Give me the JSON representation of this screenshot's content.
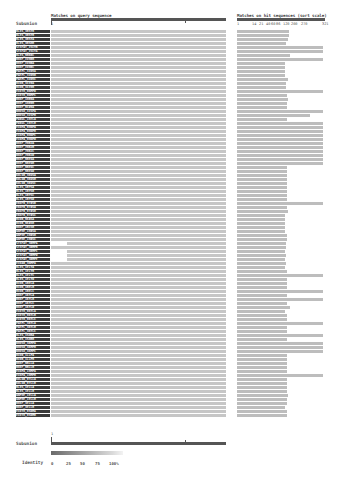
{
  "header": {
    "query_title": "Matches on query sequence",
    "hit_title": "Matches on hit sequences (sort scale)",
    "row_label_title": "Subunion"
  },
  "query_ruler": {
    "start_label": "1",
    "mid_tick_fraction": 0.76
  },
  "hit_ruler": {
    "ticks": [
      "1",
      "14",
      "21",
      "40",
      "60",
      "86",
      "120",
      "200",
      "270",
      "321"
    ]
  },
  "footer": {
    "label": "Subunion",
    "ruler_start_label": "1",
    "identity_label": "Identity",
    "identity_ticks": [
      "0",
      "25",
      "50",
      "75",
      "100%"
    ]
  },
  "colors": {
    "query_bar": "#c6c6c6",
    "hit_bar": "#bdbdbd",
    "ruler": "#555555",
    "label_bg": "#3a3a3a",
    "identity_low": "#6a6a6a",
    "identity_high": "#f3f3f3"
  },
  "rows": [
    {
      "id": "BL4S_3BSYB",
      "q": [
        0,
        1
      ],
      "h": 0.59
    },
    {
      "id": "BL4S_3BSYB",
      "q": [
        0,
        1
      ],
      "h": 0.59
    },
    {
      "id": "BL4S_3BSYA",
      "q": [
        0,
        1
      ],
      "h": 0.58
    },
    {
      "id": "BL4S_3BSHB",
      "q": [
        0,
        1
      ],
      "h": 0.56
    },
    {
      "id": "ST3FAT_ISCYB",
      "q": [
        0,
        1
      ],
      "h": 0.98
    },
    {
      "id": "ST3FAT_ISCYA",
      "q": [
        0,
        1
      ],
      "h": 0.98
    },
    {
      "id": "BL4S_9BKRC",
      "q": [
        0,
        1
      ],
      "h": 0.6
    },
    {
      "id": "BH4F_IVHRB",
      "q": [
        0,
        1
      ],
      "h": 0.98
    },
    {
      "id": "BH4F_IVHRA",
      "q": [
        0,
        1
      ],
      "h": 0.55
    },
    {
      "id": "BH4F_IVHRC",
      "q": [
        0,
        1
      ],
      "h": 0.55
    },
    {
      "id": "PAEPL_3IN5A",
      "q": [
        0,
        1
      ],
      "h": 0.55
    },
    {
      "id": "PAEPL_3IN5B",
      "q": [
        0,
        1
      ],
      "h": 0.55
    },
    {
      "id": "PAEPL_3IN5C",
      "q": [
        0,
        1
      ],
      "h": 0.58
    },
    {
      "id": "BCOR_3IX9A",
      "q": [
        0,
        1
      ],
      "h": 0.56
    },
    {
      "id": "BCOR_3IX9B",
      "q": [
        0,
        1
      ],
      "h": 0.56
    },
    {
      "id": "ECOTH_9NMPD",
      "q": [
        0,
        1
      ],
      "h": 0.98
    },
    {
      "id": "ECOTH_9NMPC",
      "q": [
        0,
        1
      ],
      "h": 0.57
    },
    {
      "id": "BH4F_1HB9A",
      "q": [
        0,
        1
      ],
      "h": 0.58
    },
    {
      "id": "BH4F_1HB9B",
      "q": [
        0,
        1
      ],
      "h": 0.57
    },
    {
      "id": "BH4F_9CD9A",
      "q": [
        0,
        1
      ],
      "h": 0.57
    },
    {
      "id": "RHOSO_3ISPA",
      "q": [
        0,
        1
      ],
      "h": 0.98
    },
    {
      "id": "RHOSO_3ISPB",
      "q": [
        0,
        1
      ],
      "h": 0.83
    },
    {
      "id": "PA9UL_1H7LA",
      "q": [
        0,
        1
      ],
      "h": 0.57
    },
    {
      "id": "PA9UL_1H7LB",
      "q": [
        0,
        1
      ],
      "h": 0.98
    },
    {
      "id": "ECOPA_9HNPA",
      "q": [
        0,
        1
      ],
      "h": 0.98
    },
    {
      "id": "ECOPA_9HNPB",
      "q": [
        0,
        1
      ],
      "h": 0.98
    },
    {
      "id": "ECOPA_9HNPC",
      "q": [
        0,
        1
      ],
      "h": 0.98
    },
    {
      "id": "ECOPA_9HNPD",
      "q": [
        0,
        1
      ],
      "h": 0.98
    },
    {
      "id": "BH4F_7HBJA",
      "q": [
        0,
        1
      ],
      "h": 0.98
    },
    {
      "id": "BH4F_7HBJB",
      "q": [
        0,
        1
      ],
      "h": 0.98
    },
    {
      "id": "BH4F_7HBJC",
      "q": [
        0,
        1
      ],
      "h": 0.98
    },
    {
      "id": "BH4F_7HBJD",
      "q": [
        0,
        1
      ],
      "h": 0.98
    },
    {
      "id": "BH4F_9BEGA",
      "q": [
        0,
        1
      ],
      "h": 0.98
    },
    {
      "id": "BH4F_9BEGB",
      "q": [
        0,
        1
      ],
      "h": 0.98
    },
    {
      "id": "BH4F_9BEGC",
      "q": [
        0,
        1
      ],
      "h": 0.57
    },
    {
      "id": "BH4F_9BEGD",
      "q": [
        0,
        1
      ],
      "h": 0.57
    },
    {
      "id": "KOLGR_3KGSA",
      "q": [
        0,
        1
      ],
      "h": 0.57
    },
    {
      "id": "KOLGR_3KGSB",
      "q": [
        0,
        1
      ],
      "h": 0.57
    },
    {
      "id": "KOLGR_3KGSC",
      "q": [
        0,
        1
      ],
      "h": 0.57
    },
    {
      "id": "BL4S_1BYSA",
      "q": [
        0,
        1
      ],
      "h": 0.57
    },
    {
      "id": "BL4S_1BYSB",
      "q": [
        0,
        1
      ],
      "h": 0.57
    },
    {
      "id": "BL4S_1BYSC",
      "q": [
        0,
        1
      ],
      "h": 0.57
    },
    {
      "id": "BL4S_1BYSD",
      "q": [
        0,
        1
      ],
      "h": 0.57
    },
    {
      "id": "EKOFR_9T8SR",
      "q": [
        0,
        1
      ],
      "h": 0.98
    },
    {
      "id": "EKOFR_9T8SA",
      "q": [
        0,
        1
      ],
      "h": 0.57
    },
    {
      "id": "EKOFR_9T8SB",
      "q": [
        0,
        1
      ],
      "h": 0.58
    },
    {
      "id": "EKOFR_9T8SC",
      "q": [
        0,
        1
      ],
      "h": 0.55
    },
    {
      "id": "BCOR_9K8SA",
      "q": [
        0,
        1
      ],
      "h": 0.55
    },
    {
      "id": "BCOR_9K8SB",
      "q": [
        0,
        1
      ],
      "h": 0.55
    },
    {
      "id": "BH4F_1BCSB",
      "q": [
        0,
        1
      ],
      "h": 0.55
    },
    {
      "id": "GNPHE_1H8SA",
      "q": [
        0,
        1
      ],
      "h": 0.55
    },
    {
      "id": "GNPHE_1H8SB",
      "q": [
        0,
        1
      ],
      "h": 0.57
    },
    {
      "id": "GNPHE_1H8SC",
      "q": [
        0,
        1
      ],
      "h": 0.57
    },
    {
      "id": "ST3FAT_3RMPA",
      "q": [
        0.09,
        1
      ],
      "h": 0.56
    },
    {
      "id": "ST3FAT_3RMPB",
      "q": [
        0,
        1
      ],
      "h": 0.56
    },
    {
      "id": "ST3FAT_3RMPC",
      "q": [
        0.09,
        1
      ],
      "h": 0.55
    },
    {
      "id": "ST3FAT_3RMPD",
      "q": [
        0.09,
        1
      ],
      "h": 0.56
    },
    {
      "id": "ST3FAT_3RMPE",
      "q": [
        0.09,
        1
      ],
      "h": 0.55
    },
    {
      "id": "ECOAR_3NMPA",
      "q": [
        0,
        1
      ],
      "h": 0.56
    },
    {
      "id": "BL4S_1ELYA",
      "q": [
        0,
        1
      ],
      "h": 0.55
    },
    {
      "id": "BL4S_1ELYB",
      "q": [
        0,
        1
      ],
      "h": 0.57
    },
    {
      "id": "BL4S_1ELYC",
      "q": [
        0,
        1
      ],
      "h": 0.98
    },
    {
      "id": "BL4S_1ELYD",
      "q": [
        0,
        1
      ],
      "h": 0.57
    },
    {
      "id": "BCOR_1BELA",
      "q": [
        0,
        1
      ],
      "h": 0.57
    },
    {
      "id": "BCOR_1BELB",
      "q": [
        0,
        1
      ],
      "h": 0.57
    },
    {
      "id": "BCOR_1BELC",
      "q": [
        0,
        1
      ],
      "h": 0.98
    },
    {
      "id": "BH4F_1KYLA",
      "q": [
        0,
        1
      ],
      "h": 0.57
    },
    {
      "id": "BH4F_1KYLB",
      "q": [
        0,
        1
      ],
      "h": 0.98
    },
    {
      "id": "BH4F_1KYLC",
      "q": [
        0,
        1
      ],
      "h": 0.57
    },
    {
      "id": "BH4F_1KYLD",
      "q": [
        0,
        1
      ],
      "h": 0.6
    },
    {
      "id": "ECOTH_9KYLA",
      "q": [
        0,
        1
      ],
      "h": 0.55
    },
    {
      "id": "ECOTH_9KYLB",
      "q": [
        0,
        1
      ],
      "h": 0.57
    },
    {
      "id": "ECOTH_9KYLC",
      "q": [
        0,
        1
      ],
      "h": 0.57
    },
    {
      "id": "PAEPL_3KYLA",
      "q": [
        0,
        1
      ],
      "h": 0.98
    },
    {
      "id": "PAEPL_3KYLB",
      "q": [
        0,
        1
      ],
      "h": 0.57
    },
    {
      "id": "PAEPL_3KYLC",
      "q": [
        0,
        1
      ],
      "h": 0.57
    },
    {
      "id": "BL4S_1SOBA",
      "q": [
        0,
        1
      ],
      "h": 0.98
    },
    {
      "id": "BL4S_1SOBB",
      "q": [
        0,
        1
      ],
      "h": 0.57
    },
    {
      "id": "RHOSO_3KMPA",
      "q": [
        0,
        1
      ],
      "h": 0.98
    },
    {
      "id": "RHOSO_3KMPB",
      "q": [
        0,
        1
      ],
      "h": 0.98
    },
    {
      "id": "RHOSO_3KMPC",
      "q": [
        0,
        1
      ],
      "h": 0.98
    },
    {
      "id": "BCOR_1LLPA",
      "q": [
        0,
        1
      ],
      "h": 0.57
    },
    {
      "id": "BCOR_1LLPB",
      "q": [
        0,
        1
      ],
      "h": 0.57
    },
    {
      "id": "BH4F_9BLLA",
      "q": [
        0,
        1
      ],
      "h": 0.57
    },
    {
      "id": "BH4F_9BLLB",
      "q": [
        0,
        1
      ],
      "h": 0.57
    },
    {
      "id": "ECOPA_1HMPA",
      "q": [
        0,
        1
      ],
      "h": 0.57
    },
    {
      "id": "ECOPA_1HMPB",
      "q": [
        0,
        1
      ],
      "h": 0.98
    },
    {
      "id": "KOLGR_9TLLA",
      "q": [
        0,
        1
      ],
      "h": 0.57
    },
    {
      "id": "KOLGR_9TLLB",
      "q": [
        0,
        1
      ],
      "h": 0.57
    },
    {
      "id": "BL4S_1ELLA",
      "q": [
        0,
        1
      ],
      "h": 0.57
    },
    {
      "id": "BL4S_1ELLB",
      "q": [
        0,
        1
      ],
      "h": 0.57
    },
    {
      "id": "GNPHE_1ELLA",
      "q": [
        0,
        1
      ],
      "h": 0.58
    },
    {
      "id": "GNPHE_1ELLB",
      "q": [
        0,
        1
      ],
      "h": 0.57
    },
    {
      "id": "BH4F_3ELLA",
      "q": [
        0,
        1
      ],
      "h": 0.57
    },
    {
      "id": "BH4F_3ELLB",
      "q": [
        0,
        1
      ],
      "h": 0.55
    },
    {
      "id": "ECOTH_9SNMA",
      "q": [
        0,
        1
      ],
      "h": 0.57
    },
    {
      "id": "ECOTH_9SNMB",
      "q": [
        0,
        1
      ],
      "h": 0.57
    }
  ]
}
